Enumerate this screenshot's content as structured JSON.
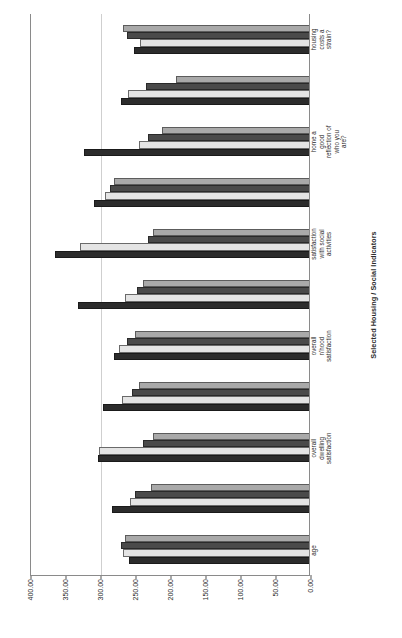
{
  "chart_data": {
    "type": "bar",
    "title": "",
    "xlabel": "Selected Housing / Social Indicators",
    "ylabel": "Mean Rank on Selected Indicators",
    "ylim": [
      0,
      400
    ],
    "yticks": [
      "0.00",
      "50.00",
      "100.00",
      "150.00",
      "200.00",
      "250.00",
      "300.00",
      "350.00",
      "400.00"
    ],
    "ytick_values": [
      0,
      50,
      100,
      150,
      200,
      250,
      300,
      350,
      400
    ],
    "grid": true,
    "legend": "none",
    "categories": [
      "age",
      "",
      "overall dwelling satisfaction",
      "",
      "overall n'hood satisfaction",
      "",
      "satisfaction with social activities",
      "",
      "home a good reflection of who you are?",
      "",
      "housing costs a strain?"
    ],
    "tick_categories": [
      "age",
      "overall dwelling satisfaction",
      "overall n'hood satisfaction",
      "satisfaction with social activities",
      "home a good reflection of who you are?",
      "housing costs a strain?"
    ],
    "series": [
      {
        "name": "Series 1",
        "color": "#2c2c2c",
        "values": [
          259,
          283,
          303,
          296,
          281,
          333,
          365,
          310,
          324,
          270,
          252
        ]
      },
      {
        "name": "Series 2",
        "color": "#e4e4e4",
        "values": [
          268,
          258,
          302,
          269,
          273,
          265,
          329,
          294,
          245,
          260,
          243
        ]
      },
      {
        "name": "Series 3",
        "color": "#4a4a4a",
        "values": [
          270,
          251,
          239,
          255,
          262,
          247,
          232,
          287,
          232,
          235,
          262
        ]
      },
      {
        "name": "Series 4",
        "color": "#a9a9a9",
        "values": [
          265,
          228,
          224,
          244,
          251,
          239,
          225,
          280,
          211,
          192,
          268
        ]
      }
    ]
  },
  "axes": {
    "y_title": "Mean Rank on Selected Indicators",
    "x_title": "Selected Housing / Social Indicators"
  }
}
